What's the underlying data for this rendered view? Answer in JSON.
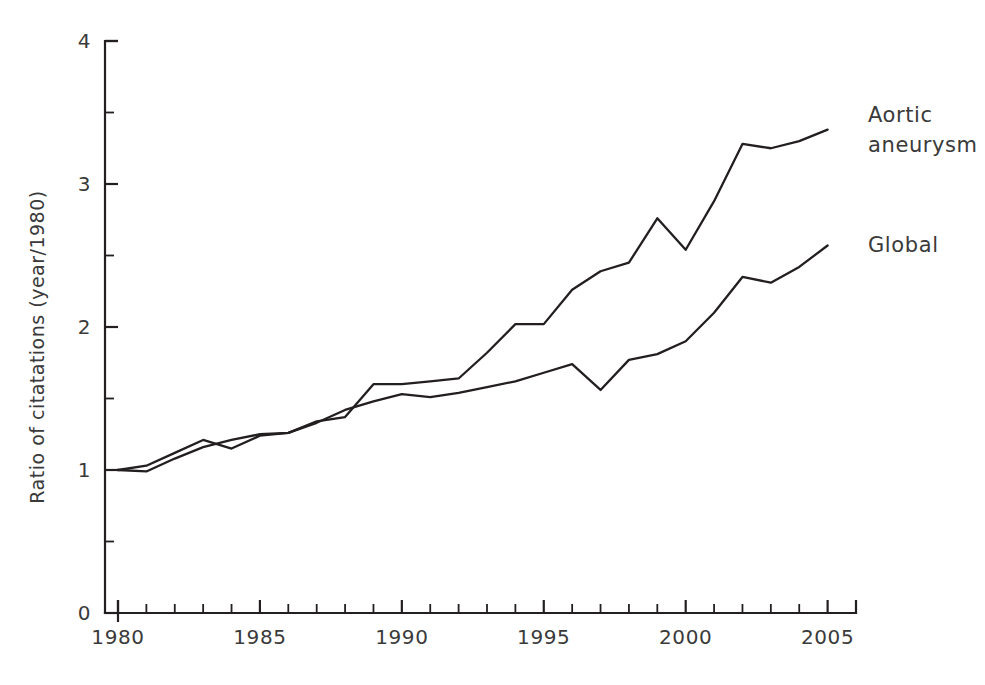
{
  "chart_data": {
    "type": "line",
    "title": "",
    "subtitle": "",
    "xlabel": "",
    "ylabel": "Ratio of citatations (year/1980)",
    "xlim": [
      1980,
      2006
    ],
    "ylim": [
      0,
      4
    ],
    "grid": false,
    "legend_position": "right-inline-annotations",
    "y_ticks_major": [
      "0",
      "1",
      "2",
      "3",
      "4"
    ],
    "y_ticks_major_values": [
      0,
      1,
      2,
      3,
      4
    ],
    "y_ticks_minor_values": [
      0.5,
      1.5,
      2.5,
      3.5
    ],
    "x_ticks_major": [
      "1980",
      "1985",
      "1990",
      "1995",
      "2000",
      "2005"
    ],
    "x_ticks_major_values": [
      1980,
      1985,
      1990,
      1995,
      2000,
      2005
    ],
    "x_ticks_minor_values": [
      1981,
      1982,
      1983,
      1984,
      1986,
      1987,
      1988,
      1989,
      1991,
      1992,
      1993,
      1994,
      1996,
      1997,
      1998,
      1999,
      2001,
      2002,
      2003,
      2004,
      2006
    ],
    "x": [
      1980,
      1981,
      1982,
      1983,
      1984,
      1985,
      1986,
      1987,
      1988,
      1989,
      1990,
      1991,
      1992,
      1993,
      1994,
      1995,
      1996,
      1997,
      1998,
      1999,
      2000,
      2001,
      2002,
      2003,
      2004,
      2005
    ],
    "series": [
      {
        "name": "Aortic aneurysm",
        "color": "#231f20",
        "label_lines": [
          "Aortic",
          "aneurysm"
        ],
        "values": [
          1.0,
          1.03,
          1.12,
          1.21,
          1.15,
          1.24,
          1.26,
          1.34,
          1.37,
          1.6,
          1.6,
          1.62,
          1.64,
          1.82,
          2.02,
          2.02,
          2.26,
          2.39,
          2.45,
          2.76,
          2.54,
          2.88,
          3.28,
          3.25,
          3.3,
          3.38
        ]
      },
      {
        "name": "Global",
        "color": "#231f20",
        "label_lines": [
          "Global"
        ],
        "values": [
          1.0,
          0.99,
          1.08,
          1.16,
          1.21,
          1.25,
          1.26,
          1.33,
          1.42,
          1.48,
          1.53,
          1.51,
          1.54,
          1.58,
          1.62,
          1.68,
          1.74,
          1.56,
          1.77,
          1.81,
          1.9,
          2.1,
          2.35,
          2.31,
          2.42,
          2.57
        ]
      }
    ],
    "annotations": [
      {
        "text": "Aortic aneurysm",
        "at_year": 2005,
        "at_value": 3.38
      },
      {
        "text": "Global",
        "at_year": 2005,
        "at_value": 2.57
      }
    ]
  }
}
